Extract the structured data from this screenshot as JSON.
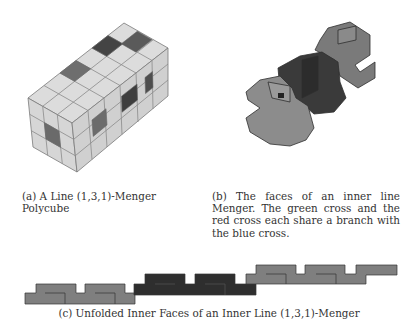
{
  "figure": {
    "subfigure_a": {
      "label": "(a)",
      "caption": "(a) A Line (1,3,1)-Menger Polycube",
      "colors": {
        "face": "#dcdcdc",
        "edge": "#7a7a7a",
        "hole_dark": "#4a4a4a",
        "hole_mid": "#6e6e6e"
      }
    },
    "subfigure_b": {
      "label": "(b)",
      "caption": "(b) The faces of an inner line Menger. The green cross and the red cross each share a branch with the blue cross.",
      "colors": {
        "green_cross": "#8c8c8c",
        "blue_cross": "#3a3a3a",
        "red_cross": "#7a7a7a",
        "edge": "#2e2e2e"
      }
    },
    "subfigure_c": {
      "label": "(c)",
      "caption": "(c) Unfolded Inner Faces of an Inner Line (1,3,1)-Menger",
      "colors": {
        "outer_piece": "#7f7f7f",
        "middle_piece": "#2e2e2e",
        "edge": "#333333"
      }
    }
  }
}
